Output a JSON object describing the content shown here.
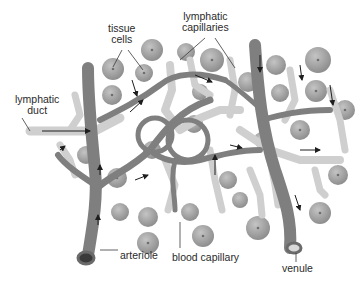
{
  "diagram": {
    "labels": {
      "tissue_cells_1": "tissue",
      "tissue_cells_2": "cells",
      "lymphatic_capillaries_1": "lymphatic",
      "lymphatic_capillaries_2": "capillaries",
      "lymphatic_duct_1": "lymphatic",
      "lymphatic_duct_2": "duct",
      "arteriole": "arteriole",
      "blood_capillary": "blood capillary",
      "venule": "venule"
    },
    "colors": {
      "background": "#ffffff",
      "tissue_cell": "#a9a9a9",
      "tissue_cell_nucleus": "#6e6e6e",
      "blood_vessel": "#7a7a7a",
      "lymphatic": "#c9c9c9",
      "arrow": "#1e1e1e",
      "label_text": "#2a2a2a"
    }
  }
}
